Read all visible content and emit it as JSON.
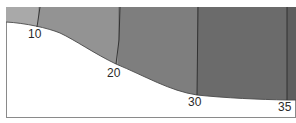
{
  "diagram": {
    "type": "contour-cross-section",
    "contour_labels": [
      "10",
      "20",
      "30",
      "35"
    ],
    "zone_colors": [
      "#a9a9a9",
      "#939393",
      "#7e7e7e",
      "#6b6b6b",
      "#5e5e5e"
    ],
    "border_color": "#8a8a8a",
    "line_color": "#2b2b2b",
    "background": "#ffffff"
  }
}
